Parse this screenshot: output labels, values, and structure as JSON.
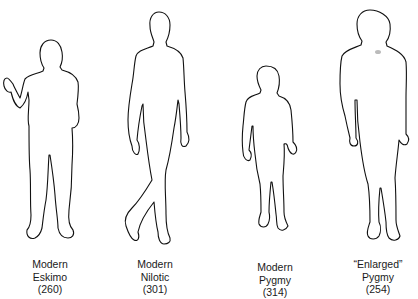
{
  "figures": [
    {
      "line1": "Modern",
      "line2": "Eskimo",
      "value": "(260)"
    },
    {
      "line1": "Modern",
      "line2": "Nilotic",
      "value": "(301)"
    },
    {
      "line1": "Modern",
      "line2": "Pygmy",
      "value": "(314)"
    },
    {
      "line1": "“Enlarged”",
      "line2": "Pygmy",
      "value": "(254)"
    }
  ],
  "colors": {
    "outline": "#111111",
    "background": "#ffffff",
    "text": "#1a1a1a"
  }
}
